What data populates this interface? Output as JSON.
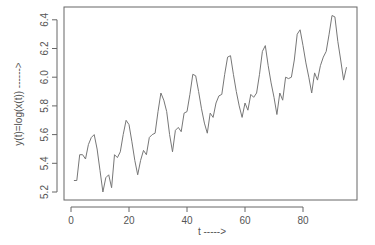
{
  "chart_data": {
    "type": "line",
    "title": "",
    "xlabel": "t ----->",
    "ylabel": "y(t)=log(x(t)) ------>",
    "xlim": [
      -2,
      98
    ],
    "ylim": [
      5.17,
      6.48
    ],
    "x_ticks": [
      0,
      20,
      40,
      60,
      80
    ],
    "y_ticks": [
      5.2,
      5.4,
      5.6,
      5.8,
      6.0,
      6.2,
      6.4
    ],
    "y_tick_labels": [
      "5.2",
      "5.4",
      "5.6",
      "5.8",
      "6.0",
      "6.2",
      "6.4"
    ],
    "x_tick_labels": [
      "0",
      "20",
      "40",
      "60",
      "80"
    ],
    "grid": false,
    "legend": null,
    "series": [
      {
        "name": "y(t)",
        "color": "#777777",
        "x": [
          1,
          2,
          3,
          4,
          5,
          6,
          7,
          8,
          9,
          10,
          11,
          12,
          13,
          14,
          15,
          16,
          17,
          18,
          19,
          20,
          21,
          22,
          23,
          24,
          25,
          26,
          27,
          28,
          29,
          30,
          31,
          32,
          33,
          34,
          35,
          36,
          37,
          38,
          39,
          40,
          41,
          42,
          43,
          44,
          45,
          46,
          47,
          48,
          49,
          50,
          51,
          52,
          53,
          54,
          55,
          56,
          57,
          58,
          59,
          60,
          61,
          62,
          63,
          64,
          65,
          66,
          67,
          68,
          69,
          70,
          71,
          72,
          73,
          74,
          75,
          76,
          77,
          78,
          79,
          80,
          81,
          82,
          83,
          84,
          85,
          86,
          87,
          88,
          89,
          90,
          91,
          92,
          93,
          94,
          95
        ],
        "values": [
          5.28,
          5.28,
          5.46,
          5.46,
          5.43,
          5.53,
          5.58,
          5.6,
          5.5,
          5.35,
          5.2,
          5.3,
          5.32,
          5.23,
          5.46,
          5.44,
          5.48,
          5.6,
          5.7,
          5.67,
          5.55,
          5.42,
          5.32,
          5.42,
          5.49,
          5.46,
          5.58,
          5.6,
          5.61,
          5.76,
          5.89,
          5.84,
          5.76,
          5.6,
          5.48,
          5.63,
          5.65,
          5.62,
          5.75,
          5.76,
          5.88,
          6.02,
          6.01,
          5.9,
          5.78,
          5.68,
          5.61,
          5.75,
          5.72,
          5.82,
          5.87,
          5.88,
          6.02,
          6.14,
          6.15,
          6.02,
          5.9,
          5.8,
          5.72,
          5.82,
          5.77,
          5.88,
          5.86,
          5.89,
          6.02,
          6.18,
          6.22,
          6.08,
          5.96,
          5.86,
          5.74,
          5.89,
          5.84,
          6.0,
          5.99,
          6.0,
          6.12,
          6.3,
          6.33,
          6.22,
          6.1,
          6.0,
          5.89,
          6.03,
          5.98,
          6.08,
          6.14,
          6.18,
          6.3,
          6.43,
          6.42,
          6.25,
          6.12,
          5.98,
          6.07
        ]
      }
    ]
  },
  "layout": {
    "plot_left": 64,
    "plot_right": 357,
    "plot_top": 7,
    "plot_bottom": 200,
    "axis_color": "#666666",
    "line_color": "#777777"
  }
}
